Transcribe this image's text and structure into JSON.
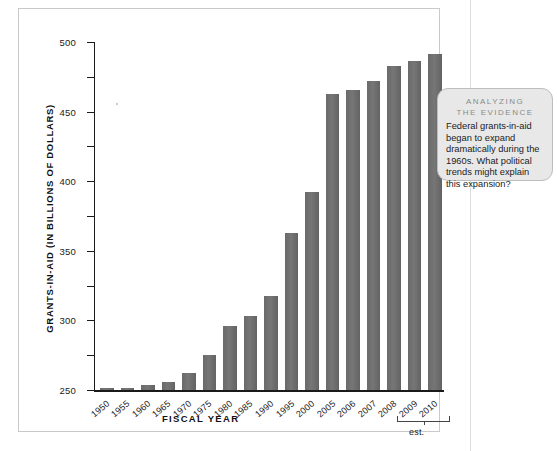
{
  "chart_data": {
    "type": "bar",
    "title": "",
    "xlabel": "FISCAL YEAR",
    "ylabel": "GRANTS-IN-AID (IN BILLIONS OF DOLLARS)",
    "ylim": [
      0,
      500
    ],
    "yticks": [
      0,
      50,
      100,
      150,
      200,
      250,
      300,
      350,
      400,
      450,
      500
    ],
    "grid": false,
    "legend": false,
    "bar_color": "#6d6d6d",
    "categories": [
      "1950",
      "1955",
      "1960",
      "1965",
      "1970",
      "1975",
      "1980",
      "1985",
      "1990",
      "1995",
      "2000",
      "2005",
      "2006",
      "2007",
      "2008",
      "2009",
      "2010"
    ],
    "values": [
      2.3,
      3.2,
      7.0,
      10.9,
      24.0,
      49.8,
      91.5,
      105.9,
      135.0,
      225.0,
      285.0,
      426.0,
      431.0,
      444.0,
      466.0,
      473.0,
      483.0
    ],
    "annotations": [
      {
        "label": "est.",
        "applies_to": [
          "2008",
          "2009",
          "2010"
        ]
      }
    ]
  },
  "callout": {
    "title_line1": "ANALYZING",
    "title_line2": "THE EVIDENCE",
    "body": "Federal grants-in-aid began to expand dramatically during the 1960s. What political trends might explain this expansion?"
  }
}
